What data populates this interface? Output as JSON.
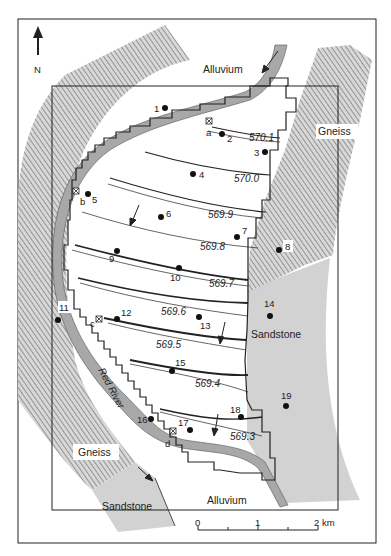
{
  "map": {
    "north_label": "N",
    "units": {
      "alluvium_top": "Alluvium",
      "alluvium_bottom": "Alluvium",
      "gneiss_right": "Gneiss",
      "gneiss_left": "Gneiss",
      "sandstone_right": "Sandstone",
      "sandstone_bottom": "Sandstone"
    },
    "river_label": "Red River",
    "contours": [
      {
        "value": "570.1"
      },
      {
        "value": "570.0"
      },
      {
        "value": "569.9"
      },
      {
        "value": "569.8"
      },
      {
        "value": "569.7"
      },
      {
        "value": "569.6"
      },
      {
        "value": "569.5"
      },
      {
        "value": "569.4"
      },
      {
        "value": "569.3"
      }
    ],
    "wells": [
      {
        "id": "1"
      },
      {
        "id": "2"
      },
      {
        "id": "3"
      },
      {
        "id": "4"
      },
      {
        "id": "5"
      },
      {
        "id": "6"
      },
      {
        "id": "7"
      },
      {
        "id": "8"
      },
      {
        "id": "9"
      },
      {
        "id": "10"
      },
      {
        "id": "11"
      },
      {
        "id": "12"
      },
      {
        "id": "13"
      },
      {
        "id": "14"
      },
      {
        "id": "15"
      },
      {
        "id": "16"
      },
      {
        "id": "17"
      },
      {
        "id": "18"
      },
      {
        "id": "19"
      }
    ],
    "gauges": [
      {
        "id": "a"
      },
      {
        "id": "b"
      },
      {
        "id": "c"
      },
      {
        "id": "d"
      }
    ],
    "scale_bar": {
      "tick_0": "0",
      "tick_1": "1",
      "tick_2": "2 km"
    },
    "colors": {
      "river": "#a8a8a8",
      "sandstone": "#d2d2d2",
      "gneiss_hatch": "#9a9a9a",
      "frame": "#222222"
    }
  }
}
